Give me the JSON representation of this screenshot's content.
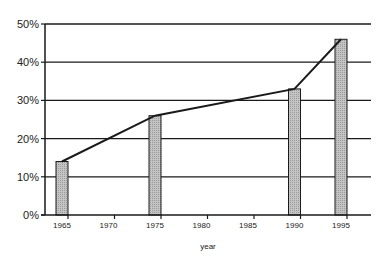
{
  "chart_data": {
    "type": "bar",
    "title": "",
    "xlabel": "year",
    "ylabel": "",
    "ylim": [
      0,
      50
    ],
    "yticks": [
      "0%",
      "10%",
      "20%",
      "30%",
      "40%",
      "50%"
    ],
    "xticks": [
      "1965",
      "1970",
      "1975",
      "1980",
      "1985",
      "1990",
      "1995"
    ],
    "grid": true,
    "legend": null,
    "categories": [
      "1965",
      "1975",
      "1990",
      "1995"
    ],
    "series": [
      {
        "name": "bars",
        "type": "bar",
        "values": [
          14,
          26,
          33,
          46
        ]
      },
      {
        "name": "line",
        "type": "line",
        "values": [
          14,
          26,
          33,
          46
        ]
      }
    ]
  },
  "colors": {
    "bar_fill": "#b8b8b8",
    "line": "#1a1a1a",
    "grid": "#1a1a1a"
  }
}
